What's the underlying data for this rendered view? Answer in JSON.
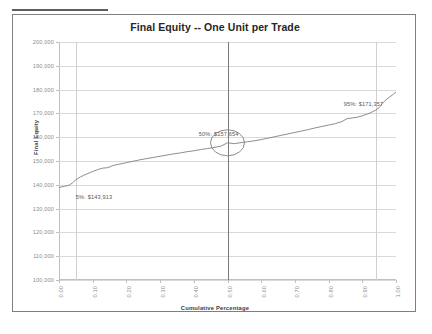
{
  "top_strip": {
    "ghost_text": ""
  },
  "chart_data": {
    "type": "line",
    "title": "Final Equity -- One Unit per Trade",
    "xlabel": "Cumulative Percentage",
    "ylabel": "Final Equity",
    "xlim": [
      0.0,
      1.0
    ],
    "ylim": [
      100000,
      200000
    ],
    "grid": true,
    "legend": "none",
    "y_ticks": [
      100000,
      110000,
      120000,
      130000,
      140000,
      150000,
      160000,
      170000,
      180000,
      190000,
      200000
    ],
    "y_tick_labels": [
      "100,000",
      "110,000",
      "120,000",
      "130,000",
      "140,000",
      "150,000",
      "160,000",
      "170,000",
      "180,000",
      "190,000",
      "200,000"
    ],
    "x_ticks": [
      0.0,
      0.1,
      0.2,
      0.3,
      0.4,
      0.5,
      0.6,
      0.7,
      0.8,
      0.9,
      1.0
    ],
    "x_tick_labels": [
      "0.00",
      "0.10",
      "0.20",
      "0.30",
      "0.40",
      "0.50",
      "0.60",
      "0.70",
      "0.80",
      "0.90",
      "1.00"
    ],
    "series": [
      {
        "name": "Final Equity",
        "color": "#808080",
        "x": [
          0.0,
          0.008,
          0.016,
          0.024,
          0.032,
          0.04,
          0.048,
          0.056,
          0.064,
          0.072,
          0.08,
          0.09,
          0.1,
          0.115,
          0.13,
          0.145,
          0.16,
          0.18,
          0.2,
          0.22,
          0.24,
          0.26,
          0.28,
          0.3,
          0.32,
          0.34,
          0.36,
          0.38,
          0.4,
          0.42,
          0.44,
          0.46,
          0.48,
          0.5,
          0.52,
          0.54,
          0.56,
          0.58,
          0.6,
          0.62,
          0.64,
          0.66,
          0.68,
          0.7,
          0.72,
          0.74,
          0.76,
          0.78,
          0.8,
          0.82,
          0.84,
          0.855,
          0.87,
          0.885,
          0.9,
          0.92,
          0.94,
          0.95,
          0.96,
          0.97,
          0.98,
          0.99,
          1.0
        ],
        "y": [
          138900,
          139100,
          139400,
          139600,
          140000,
          140800,
          141900,
          142700,
          143300,
          143913,
          144400,
          145000,
          145600,
          146400,
          147000,
          147200,
          148100,
          148700,
          149300,
          149900,
          150500,
          151000,
          151500,
          152000,
          152500,
          153000,
          153400,
          153900,
          154300,
          154800,
          155200,
          155700,
          156200,
          157654,
          157300,
          157700,
          158100,
          158500,
          159000,
          159600,
          160200,
          160800,
          161400,
          162000,
          162600,
          163200,
          163900,
          164500,
          165100,
          165700,
          166600,
          167800,
          168100,
          168400,
          169000,
          170000,
          171357,
          172400,
          174300,
          175700,
          176800,
          177800,
          179000
        ]
      }
    ],
    "reference_lines": [
      {
        "name": "p5-line",
        "x": 0.05,
        "style": "minor"
      },
      {
        "name": "p50-line",
        "x": 0.5,
        "style": "major"
      },
      {
        "name": "p95-line",
        "x": 0.94,
        "style": "minor"
      }
    ],
    "marker_ellipse": {
      "name": "p50-highlight",
      "x": 0.5,
      "y": 157654,
      "rx": 17,
      "ry": 13
    },
    "annotations": [
      {
        "name": "p5-annotation",
        "text": "5%: $143,913",
        "x": 0.05,
        "y": 136000,
        "percentile": 5,
        "value": 143913
      },
      {
        "name": "p50-annotation",
        "text": "50%: $157,654",
        "x": 0.415,
        "y": 162600,
        "percentile": 50,
        "value": 157654
      },
      {
        "name": "p95-annotation",
        "text": "95%: $171,357",
        "x": 0.845,
        "y": 175200,
        "percentile": 95,
        "value": 171357
      }
    ]
  }
}
